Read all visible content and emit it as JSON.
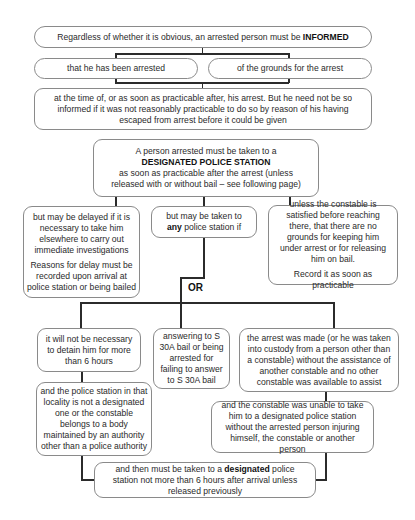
{
  "top": {
    "informed": {
      "text": "Regardless of whether it is obvious, an arrested person must be ",
      "emph": "INFORMED"
    },
    "arrested": "that he has been arrested",
    "grounds": "of the grounds for the arrest",
    "timing": "at the time of, or as soon as practicable after, his arrest. But he need not be so informed if it was not reasonably practicable to do so by reason of his having escaped from arrest before it could be given"
  },
  "designated": {
    "line1": "A person arrested must be taken to a",
    "emph": "DESIGNATED POLICE STATION",
    "line3": "as soon as practicable after the arrest (unless released with or without bail – see following page)"
  },
  "branches": {
    "delay": {
      "p1": "but may be delayed if it is necessary to take him elsewhere to carry out immediate investigations",
      "p2": "Reasons for delay must be recorded upon arrival at police station or being bailed"
    },
    "any": {
      "pre": "but may be taken to ",
      "emph": "any",
      "post": " police station if"
    },
    "unless": {
      "p1": "unless the constable is satisfied before reaching there, that there are no grounds for keeping him under arrest or for releasing him on bail.",
      "p2": "Record it as soon as practicable"
    }
  },
  "or_label": "OR",
  "conditions": {
    "six_hours": "it will not be necessary to detain him for more than 6 hours",
    "locality": "and the police station in that locality is not a designated one or the constable belongs to a body maintained by an authority other than a police authority",
    "s30a": "answering to S 30A bail or being arrested for failing to answer to S 30A bail",
    "no_assist": "the arrest was made (or he was taken into custody from a person other than a constable) without the assistance of another constable and no other constable was available to assist",
    "unable": "and the constable was unable to take him to a designated police station without the arrested person injuring himself, the constable or another person"
  },
  "final": {
    "pre": "and then must be taken to a ",
    "emph": "designated",
    "post": " police station not more than 6 hours after arrival unless released previously"
  }
}
